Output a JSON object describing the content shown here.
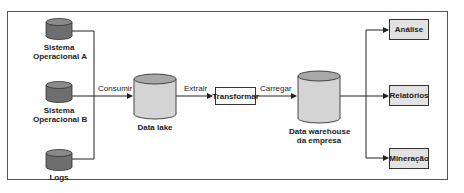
{
  "diagram": {
    "sources": [
      {
        "label_line1": "Sistema",
        "label_line2": "Operacional A"
      },
      {
        "label_line1": "Sistema",
        "label_line2": "Operacional B"
      },
      {
        "label_line1": "Logs",
        "label_line2": ""
      }
    ],
    "data_lake": {
      "label": "Data lake"
    },
    "transform": {
      "label": "Transformar"
    },
    "warehouse": {
      "label_line1": "Data warehouse",
      "label_line2": "da empresa"
    },
    "outputs": [
      {
        "label": "Análise"
      },
      {
        "label": "Relatórios"
      },
      {
        "label": "Mineração"
      }
    ],
    "edges": {
      "consume": "Consumir",
      "extract": "Extrair",
      "load": "Carregar"
    },
    "colors": {
      "source_cylinder": "#6e6e6e",
      "store_cylinder": "#d4d4d4",
      "output_box": "#e2e2e2",
      "line": "#222222"
    }
  }
}
